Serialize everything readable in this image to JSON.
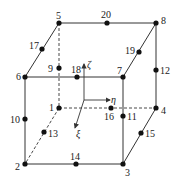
{
  "diagram": {
    "colors": {
      "line": "#333333",
      "node": "#111111",
      "background": "#ffffff"
    },
    "corner_nodes": [
      {
        "id": "1",
        "x": 59,
        "y": 108
      },
      {
        "id": "2",
        "x": 25,
        "y": 164
      },
      {
        "id": "3",
        "x": 123,
        "y": 164
      },
      {
        "id": "4",
        "x": 156,
        "y": 108
      },
      {
        "id": "5",
        "x": 59,
        "y": 23
      },
      {
        "id": "6",
        "x": 25,
        "y": 77
      },
      {
        "id": "7",
        "x": 123,
        "y": 77
      },
      {
        "id": "8",
        "x": 156,
        "y": 23
      }
    ],
    "mid_nodes": [
      {
        "id": "9",
        "x": 59,
        "y": 68
      },
      {
        "id": "10",
        "x": 25,
        "y": 119
      },
      {
        "id": "11",
        "x": 123,
        "y": 116
      },
      {
        "id": "12",
        "x": 156,
        "y": 70
      },
      {
        "id": "13",
        "x": 44,
        "y": 132
      },
      {
        "id": "14",
        "x": 76,
        "y": 164
      },
      {
        "id": "15",
        "x": 141,
        "y": 133
      },
      {
        "id": "16",
        "x": 111,
        "y": 108
      },
      {
        "id": "17",
        "x": 42,
        "y": 49
      },
      {
        "id": "18",
        "x": 77,
        "y": 77
      },
      {
        "id": "19",
        "x": 139,
        "y": 52
      },
      {
        "id": "20",
        "x": 107,
        "y": 23
      }
    ],
    "labels": [
      {
        "text": "1",
        "x": 49,
        "y": 111
      },
      {
        "text": "2",
        "x": 15,
        "y": 170
      },
      {
        "text": "3",
        "x": 125,
        "y": 176
      },
      {
        "text": "4",
        "x": 161,
        "y": 114
      },
      {
        "text": "5",
        "x": 56,
        "y": 19
      },
      {
        "text": "6",
        "x": 16,
        "y": 80
      },
      {
        "text": "7",
        "x": 117,
        "y": 74
      },
      {
        "text": "8",
        "x": 161,
        "y": 24
      },
      {
        "text": "9",
        "x": 48,
        "y": 72
      },
      {
        "text": "10",
        "x": 10,
        "y": 123
      },
      {
        "text": "11",
        "x": 127,
        "y": 120
      },
      {
        "text": "12",
        "x": 160,
        "y": 74
      },
      {
        "text": "13",
        "x": 48,
        "y": 137
      },
      {
        "text": "14",
        "x": 70,
        "y": 160
      },
      {
        "text": "15",
        "x": 145,
        "y": 137
      },
      {
        "text": "16",
        "x": 104,
        "y": 120
      },
      {
        "text": "17",
        "x": 29,
        "y": 49
      },
      {
        "text": "18",
        "x": 71,
        "y": 73
      },
      {
        "text": "19",
        "x": 125,
        "y": 54
      },
      {
        "text": "20",
        "x": 101,
        "y": 18
      }
    ],
    "axes": {
      "origin": {
        "x": 84,
        "y": 100
      },
      "zeta": {
        "label": "ζ",
        "x2": 84,
        "y2": 64,
        "lx": 87,
        "ly": 68
      },
      "eta": {
        "label": "η",
        "x2": 110,
        "y2": 100,
        "lx": 111,
        "ly": 103
      },
      "xi": {
        "label": "ξ",
        "x2": 75,
        "y2": 128,
        "lx": 76,
        "ly": 137
      }
    }
  }
}
